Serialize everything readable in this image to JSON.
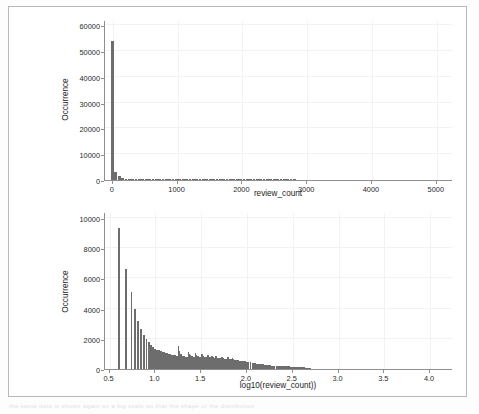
{
  "page": {
    "background_color": "#ffffff",
    "frame_color": "#b9b9b9",
    "bar_color": "#6d6d6d",
    "axis_color": "#8f8f8f",
    "grid_color": "#f2f2f2",
    "bleed_text": "the same data is shown again on a log scale so that the shape of the distribution"
  },
  "chart_data": [
    {
      "type": "bar",
      "title": "",
      "xlabel": "review_count",
      "ylabel": "Occurrence",
      "xlim": [
        -120,
        5250
      ],
      "ylim": [
        0,
        62000
      ],
      "xticks": [
        0,
        1000,
        2000,
        3000,
        4000,
        5000
      ],
      "xticklabels": [
        "0",
        "1000",
        "2000",
        "3000",
        "4000",
        "5000"
      ],
      "yticks": [
        0,
        10000,
        20000,
        30000,
        40000,
        50000,
        60000
      ],
      "yticklabels": [
        "0",
        "10000",
        "20000",
        "30000",
        "40000",
        "50000",
        "60000"
      ],
      "grid": true,
      "legend": "none",
      "bin_width": 52,
      "x": [
        0,
        52,
        104,
        156,
        208,
        260,
        312,
        364,
        416,
        468,
        520,
        572,
        624,
        676,
        728,
        780,
        832,
        884,
        936,
        988,
        1040,
        1092,
        1144,
        1196,
        1248,
        1300,
        1352,
        1404,
        1456,
        1508,
        1560,
        1612,
        1664,
        1716,
        1768,
        1820,
        1872,
        1924,
        1976,
        2028,
        2080,
        2132,
        2184,
        2236,
        2288,
        2340,
        2392,
        2444,
        2496,
        2548,
        2600,
        2652,
        2704,
        2756,
        2808,
        2860,
        2912,
        2964,
        3016,
        3068,
        3120,
        3172,
        3224,
        3276,
        3328,
        3380,
        3432,
        3484,
        3536,
        3588,
        3640,
        3692,
        3744,
        3796,
        3848,
        3900,
        3952,
        4004,
        4056,
        4108,
        4160,
        4212,
        4264,
        4316,
        4368,
        4420,
        4472,
        4524,
        4576,
        4628,
        4680,
        4732,
        4784,
        4836,
        4888,
        4940,
        4992,
        5044,
        5096,
        5148
      ],
      "values": [
        53900,
        3050,
        1420,
        820,
        520,
        350,
        250,
        180,
        140,
        110,
        86,
        70,
        58,
        48,
        40,
        34,
        29,
        25,
        21,
        18,
        16,
        14,
        12,
        11,
        9,
        8,
        7,
        6,
        6,
        5,
        90,
        70,
        55,
        40,
        30,
        20,
        14,
        10,
        7,
        5,
        4,
        3,
        3,
        2,
        2,
        2,
        1,
        1,
        1,
        1,
        1,
        1,
        1,
        1,
        1,
        0,
        0,
        0,
        0,
        0,
        0,
        0,
        0,
        0,
        0,
        0,
        0,
        0,
        0,
        0,
        0,
        0,
        0,
        0,
        0,
        0,
        0,
        0,
        0,
        0,
        0,
        0,
        0,
        0,
        0,
        0,
        0,
        0,
        0,
        0,
        0,
        0,
        0,
        0,
        0,
        0,
        0,
        0,
        0,
        0
      ]
    },
    {
      "type": "bar",
      "title": "",
      "xlabel": "log10(review_count))",
      "ylabel": "Occurrence",
      "xlim": [
        0.45,
        4.25
      ],
      "ylim": [
        0,
        10400
      ],
      "xticks": [
        0.5,
        1.0,
        1.5,
        2.0,
        2.5,
        3.0,
        3.5,
        4.0
      ],
      "xticklabels": [
        "0.5",
        "1.0",
        "1.5",
        "2.0",
        "2.5",
        "3.0",
        "3.5",
        "4.0"
      ],
      "yticks": [
        0,
        2000,
        4000,
        6000,
        8000,
        10000
      ],
      "yticklabels": [
        "0",
        "2000",
        "4000",
        "6000",
        "8000",
        "10000"
      ],
      "grid": true,
      "legend": "none",
      "bin_width": 0.0206,
      "x": [
        0.602,
        0.6785,
        0.7404,
        0.7782,
        0.8129,
        0.8451,
        0.8751,
        0.9031,
        0.9294,
        0.9542,
        0.9777,
        1.0,
        1.0212,
        1.0414,
        1.0607,
        1.0792,
        1.0969,
        1.1139,
        1.1303,
        1.1461,
        1.1614,
        1.1761,
        1.1903,
        1.2041,
        1.2175,
        1.2304,
        1.243,
        1.2553,
        1.2672,
        1.2788,
        1.29,
        1.301,
        1.3118,
        1.3222,
        1.3324,
        1.3424,
        1.3522,
        1.3617,
        1.3711,
        1.3802,
        1.3892,
        1.3979,
        1.4065,
        1.415,
        1.4232,
        1.4314,
        1.4393,
        1.4472,
        1.4548,
        1.4624,
        1.4698,
        1.4771,
        1.4843,
        1.4914,
        1.4983,
        1.5051,
        1.5119,
        1.5185,
        1.525,
        1.5315,
        1.5378,
        1.5441,
        1.5502,
        1.5563,
        1.5623,
        1.5682,
        1.574,
        1.5798,
        1.5855,
        1.5911,
        1.5966,
        1.6021,
        1.6075,
        1.6128,
        1.618,
        1.6232,
        1.6284,
        1.6335,
        1.6385,
        1.6435,
        1.6484,
        1.6532,
        1.6628,
        1.6721,
        1.6812,
        1.6902,
        1.699,
        1.7076,
        1.716,
        1.7243,
        1.7324,
        1.7404,
        1.7482,
        1.7559,
        1.7634,
        1.7709,
        1.7782,
        1.7853,
        1.7924,
        1.7993,
        1.8062,
        1.8129,
        1.8195,
        1.8261,
        1.8325,
        1.8388,
        1.8451,
        1.8513,
        1.8573,
        1.8633,
        1.8692,
        1.8751,
        1.8865,
        1.8976,
        1.9085,
        1.9191,
        1.9294,
        1.9395,
        1.9494,
        1.959,
        1.9685,
        1.9777,
        1.9868,
        2.0,
        2.0212,
        2.0414,
        2.0607,
        2.0792,
        2.0969,
        2.1139,
        2.1303,
        2.1461,
        2.1614,
        2.1761,
        2.1903,
        2.2041,
        2.2175,
        2.2304,
        2.243,
        2.2553,
        2.2672,
        2.2788,
        2.29,
        2.301,
        2.3222,
        2.3424,
        2.3617,
        2.3802,
        2.3979,
        2.415,
        2.4314,
        2.4472,
        2.4624,
        2.4771,
        2.4914,
        2.5051,
        2.5185,
        2.5315,
        2.5441,
        2.5563,
        2.5682,
        2.5798,
        2.5911,
        2.6021,
        2.6128,
        2.6232,
        2.6335,
        2.6435,
        2.6532,
        2.6628,
        2.6721,
        2.6812,
        2.6902
      ],
      "values": [
        9350,
        6650,
        5080,
        3950,
        3180,
        2620,
        2250,
        2000,
        1790,
        1610,
        1460,
        1340,
        1290,
        1240,
        1190,
        1150,
        1120,
        1080,
        1050,
        1020,
        990,
        960,
        940,
        920,
        900,
        880,
        870,
        1550,
        1200,
        1000,
        870,
        840,
        830,
        820,
        810,
        800,
        790,
        1130,
        980,
        900,
        860,
        840,
        830,
        820,
        810,
        800,
        1050,
        910,
        870,
        850,
        830,
        820,
        810,
        800,
        790,
        780,
        980,
        860,
        830,
        820,
        810,
        800,
        790,
        780,
        770,
        760,
        920,
        820,
        800,
        790,
        780,
        770,
        760,
        750,
        740,
        880,
        790,
        770,
        760,
        750,
        740,
        730,
        860,
        760,
        740,
        730,
        720,
        710,
        700,
        690,
        820,
        720,
        700,
        690,
        680,
        670,
        660,
        650,
        780,
        690,
        670,
        660,
        650,
        640,
        630,
        620,
        740,
        650,
        630,
        620,
        610,
        600,
        590,
        580,
        570,
        560,
        550,
        540,
        530,
        520,
        510,
        500,
        490,
        480,
        470,
        440,
        420,
        400,
        380,
        360,
        345,
        330,
        315,
        300,
        290,
        280,
        270,
        260,
        250,
        240,
        230,
        225,
        220,
        215,
        210,
        205,
        200,
        195,
        190,
        185,
        180,
        175,
        170,
        165,
        160,
        155,
        150,
        145,
        140,
        135,
        130,
        125,
        120,
        115,
        110,
        105,
        100,
        95,
        90,
        85,
        80,
        70,
        60,
        50,
        40,
        30,
        20
      ]
    }
  ]
}
